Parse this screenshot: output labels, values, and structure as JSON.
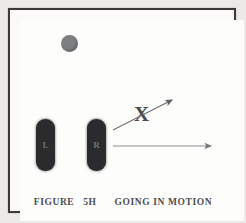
{
  "figure": {
    "caption_label": "FIGURE",
    "caption_number": "5H",
    "caption_title": "GOING IN MOTION",
    "background_color": "#fdfdfc",
    "border_color": "#3a3a3c",
    "ink_color": "#4d4d4f"
  },
  "ball": {
    "name": "football",
    "color": "#7e7f80",
    "x": 61,
    "y": 35,
    "diameter": 17
  },
  "markers": [
    {
      "label": "L",
      "role": "left-player",
      "color": "#2b2b2d",
      "x": 36,
      "y": 119,
      "width": 19,
      "height": 52
    },
    {
      "label": "R",
      "role": "right-player",
      "color": "#2b2b2d",
      "x": 87,
      "y": 119,
      "width": 19,
      "height": 52
    }
  ],
  "annotations": {
    "x_mark": {
      "label": "X",
      "x": 134,
      "y": 104,
      "color": "#4b4b4d"
    },
    "diagonal_arrow": {
      "name": "motion-path-arrow",
      "x1": 113,
      "y1": 130,
      "x2": 173,
      "y2": 100,
      "color": "#6e6e70"
    },
    "horizontal_arrow": {
      "name": "motion-direction-arrow",
      "x1": 113,
      "y1": 146,
      "x2": 212,
      "y2": 146,
      "color": "#8d8d8f"
    }
  }
}
